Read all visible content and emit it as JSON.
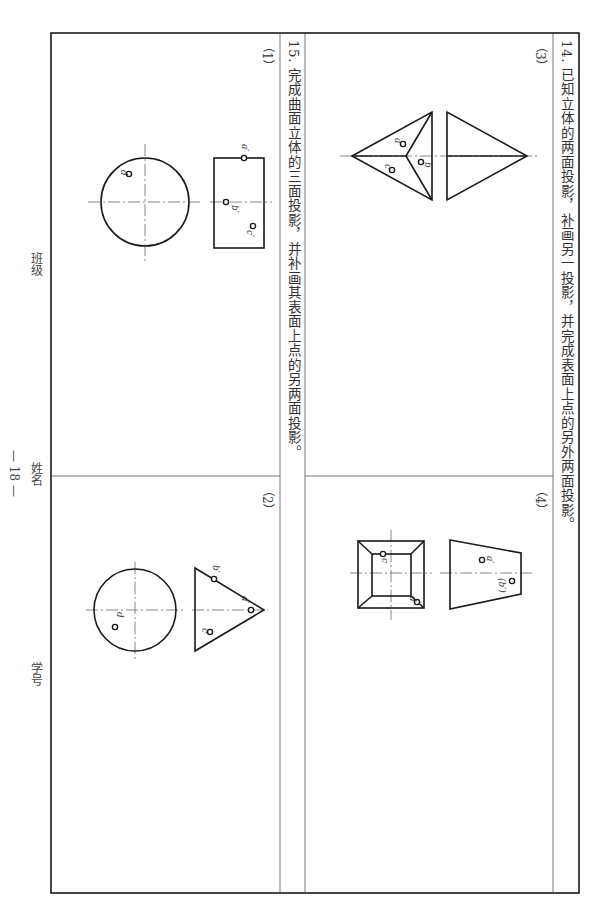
{
  "problem14": {
    "title": "14. 已知立体的两面投影，补画另一投影，并完成表面上点的另外两面投影。",
    "parts": [
      {
        "label": "（3）",
        "points": [
          "a",
          "b",
          "c"
        ]
      },
      {
        "label": "（4）",
        "points": [
          "a′",
          "(b′)",
          "c",
          "d"
        ]
      }
    ]
  },
  "problem15": {
    "title": "15. 完成曲面立体的三面投影，并补画其表面上点的另两面投影。",
    "parts": [
      {
        "label": "（1）",
        "points": [
          "a′",
          "b′",
          "c′",
          "d"
        ]
      },
      {
        "label": "（2）",
        "points": [
          "b′",
          "a′",
          "c′",
          "d"
        ]
      }
    ]
  },
  "footer": {
    "class_label": "班级",
    "name_label": "姓名",
    "id_label": "学号",
    "page_number": "— 18 —"
  },
  "labels": {
    "p3_a": "a",
    "p3_b": "b",
    "p3_c": "c",
    "p4_a": "a′",
    "p4_b": "(b′)",
    "p4_c": "c",
    "p4_d": "d",
    "p1_a": "a′",
    "p1_b": "b′",
    "p1_c": "c′",
    "p1_d": "d",
    "p2_b": "b′",
    "p2_a": "a′",
    "p2_c": "c′",
    "p2_d": "d"
  }
}
